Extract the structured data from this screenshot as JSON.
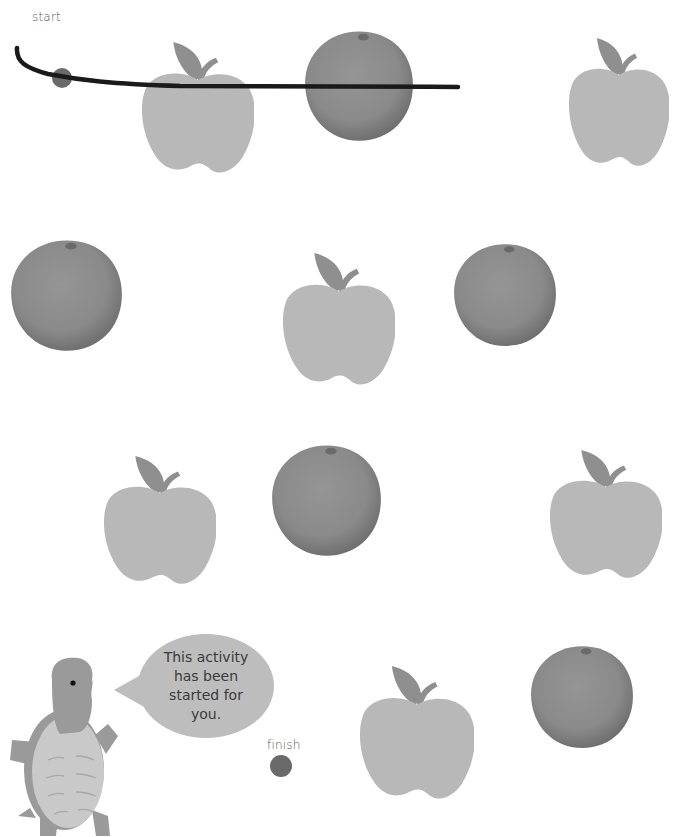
{
  "worksheet": {
    "start_label": "start",
    "finish_label": "finish",
    "speech_bubble": {
      "lines": [
        "This activity",
        "has been",
        "started for",
        "you."
      ]
    },
    "colors": {
      "background": "#ffffff",
      "apple_body": "#b8b8b8",
      "apple_leaf": "#8f8f8f",
      "orange": "#8a8a8a",
      "dot": "#6a6a6a",
      "drawn_line": "#1a1a1a",
      "turtle_skin": "#9a9a9a",
      "turtle_shell": "#c9c9c9",
      "bubble": "#bdbdbd"
    },
    "fruits": [
      {
        "type": "apple",
        "x": 142,
        "y": 42,
        "w": 112,
        "h": 135
      },
      {
        "type": "orange",
        "x": 304,
        "y": 27,
        "w": 110,
        "h": 116
      },
      {
        "type": "apple",
        "x": 569,
        "y": 38,
        "w": 100,
        "h": 132
      },
      {
        "type": "orange",
        "x": 10,
        "y": 236,
        "w": 113,
        "h": 117
      },
      {
        "type": "apple",
        "x": 283,
        "y": 253,
        "w": 112,
        "h": 136
      },
      {
        "type": "orange",
        "x": 453,
        "y": 240,
        "w": 104,
        "h": 108
      },
      {
        "type": "apple",
        "x": 104,
        "y": 456,
        "w": 112,
        "h": 132
      },
      {
        "type": "orange",
        "x": 271,
        "y": 441,
        "w": 111,
        "h": 117
      },
      {
        "type": "apple",
        "x": 550,
        "y": 450,
        "w": 112,
        "h": 132
      },
      {
        "type": "apple",
        "x": 360,
        "y": 666,
        "w": 114,
        "h": 137
      },
      {
        "type": "orange",
        "x": 530,
        "y": 642,
        "w": 104,
        "h": 108
      }
    ]
  }
}
